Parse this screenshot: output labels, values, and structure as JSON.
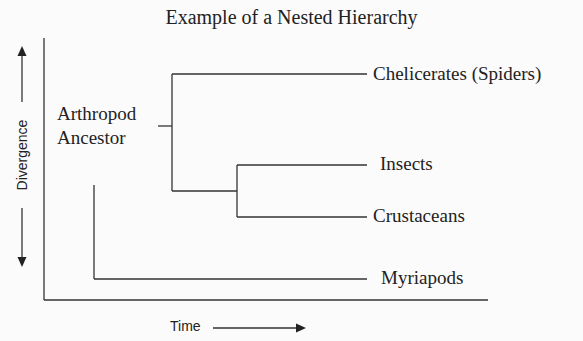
{
  "title": "Example of a Nested Hierarchy",
  "axes": {
    "y_label": "Divergence",
    "x_label": "Time"
  },
  "root": {
    "label_line1": "Arthropod",
    "label_line2": "Ancestor"
  },
  "leaves": {
    "chelicerates": "Chelicerates (Spiders)",
    "insects": "Insects",
    "crustaceans": "Crustaceans",
    "myriapods": "Myriapods"
  },
  "colors": {
    "line": "#333333",
    "text": "#222222",
    "background": "#fbfbfb"
  }
}
